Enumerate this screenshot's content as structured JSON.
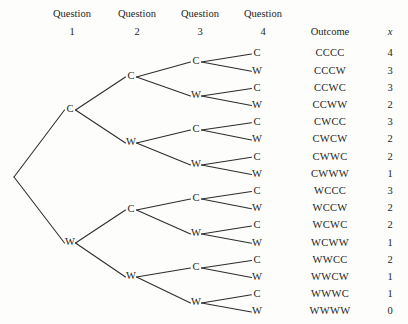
{
  "diagram": {
    "type": "probability-tree",
    "background_color": "#fdfdfb",
    "line_color": "#2c2c2c",
    "text_color": "#1d1d1d"
  },
  "headers": {
    "stage_label": "Question",
    "stages": [
      {
        "label": "Question",
        "number": "1",
        "cx": 72
      },
      {
        "label": "Question",
        "number": "2",
        "cx": 137
      },
      {
        "label": "Question",
        "number": "3",
        "cx": 200
      },
      {
        "label": "Question",
        "number": "4",
        "cx": 263
      }
    ],
    "outcome_label": "Outcome",
    "outcome_cx": 330,
    "x_label": "x",
    "x_cx": 390,
    "row1_y": 15,
    "row2_y": 33
  },
  "geometry": {
    "root_x": 14,
    "root_y": 177,
    "level_x": [
      70,
      131,
      196,
      257
    ],
    "leaf_top_y": 54,
    "leaf_spacing": 17.2,
    "outcome_x": 330,
    "xvalue_x": 390
  },
  "symbols": {
    "correct": "C",
    "wrong": "W"
  },
  "nodes_level1": [
    {
      "label": "C",
      "x": 70,
      "y": 110
    },
    {
      "label": "W",
      "x": 70,
      "y": 243
    }
  ],
  "nodes_level2": [
    {
      "label": "C",
      "x": 131,
      "y": 77
    },
    {
      "label": "W",
      "x": 131,
      "y": 143
    },
    {
      "label": "C",
      "x": 131,
      "y": 210
    },
    {
      "label": "W",
      "x": 131,
      "y": 277
    }
  ],
  "nodes_level3": [
    {
      "label": "C",
      "x": 196,
      "y": 62
    },
    {
      "label": "W",
      "x": 196,
      "y": 96
    },
    {
      "label": "C",
      "x": 196,
      "y": 130
    },
    {
      "label": "W",
      "x": 196,
      "y": 165
    },
    {
      "label": "C",
      "x": 196,
      "y": 199
    },
    {
      "label": "W",
      "x": 196,
      "y": 234
    },
    {
      "label": "C",
      "x": 196,
      "y": 268
    },
    {
      "label": "W",
      "x": 196,
      "y": 303
    }
  ],
  "rows": [
    {
      "leaf": "C",
      "outcome": "CCCC",
      "x": "4"
    },
    {
      "leaf": "W",
      "outcome": "CCCW",
      "x": "3"
    },
    {
      "leaf": "C",
      "outcome": "CCWC",
      "x": "3"
    },
    {
      "leaf": "W",
      "outcome": "CCWW",
      "x": "2"
    },
    {
      "leaf": "C",
      "outcome": "CWCC",
      "x": "3"
    },
    {
      "leaf": "W",
      "outcome": "CWCW",
      "x": "2"
    },
    {
      "leaf": "C",
      "outcome": "CWWC",
      "x": "2"
    },
    {
      "leaf": "W",
      "outcome": "CWWW",
      "x": "1"
    },
    {
      "leaf": "C",
      "outcome": "WCCC",
      "x": "3"
    },
    {
      "leaf": "W",
      "outcome": "WCCW",
      "x": "2"
    },
    {
      "leaf": "C",
      "outcome": "WCWC",
      "x": "2"
    },
    {
      "leaf": "W",
      "outcome": "WCWW",
      "x": "1"
    },
    {
      "leaf": "C",
      "outcome": "WWCC",
      "x": "2"
    },
    {
      "leaf": "W",
      "outcome": "WWCW",
      "x": "1"
    },
    {
      "leaf": "C",
      "outcome": "WWWC",
      "x": "1"
    },
    {
      "leaf": "W",
      "outcome": "WWWW",
      "x": "0"
    }
  ],
  "chart_data": {
    "type": "table",
    "columns": [
      "Question 1",
      "Question 2",
      "Question 3",
      "Question 4",
      "Outcome",
      "x"
    ],
    "rows": [
      [
        "C",
        "C",
        "C",
        "C",
        "CCCC",
        4
      ],
      [
        "C",
        "C",
        "C",
        "W",
        "CCCW",
        3
      ],
      [
        "C",
        "C",
        "W",
        "C",
        "CCWC",
        3
      ],
      [
        "C",
        "C",
        "W",
        "W",
        "CCWW",
        2
      ],
      [
        "C",
        "W",
        "C",
        "C",
        "CWCC",
        3
      ],
      [
        "C",
        "W",
        "C",
        "W",
        "CWCW",
        2
      ],
      [
        "C",
        "W",
        "W",
        "C",
        "CWWC",
        2
      ],
      [
        "C",
        "W",
        "W",
        "W",
        "CWWW",
        1
      ],
      [
        "W",
        "C",
        "C",
        "C",
        "WCCC",
        3
      ],
      [
        "W",
        "C",
        "C",
        "W",
        "WCCW",
        2
      ],
      [
        "W",
        "C",
        "W",
        "C",
        "WCWC",
        2
      ],
      [
        "W",
        "C",
        "W",
        "W",
        "WCWW",
        1
      ],
      [
        "W",
        "W",
        "C",
        "C",
        "WWCC",
        2
      ],
      [
        "W",
        "W",
        "C",
        "W",
        "WWCW",
        1
      ],
      [
        "W",
        "W",
        "W",
        "C",
        "WWWC",
        1
      ],
      [
        "W",
        "W",
        "W",
        "W",
        "WWWW",
        0
      ]
    ]
  }
}
